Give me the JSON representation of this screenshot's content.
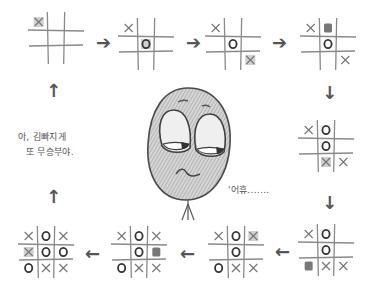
{
  "colors": {
    "ink": "#4a4a4a",
    "pencil": "#8a8a8a",
    "shade": "#777777",
    "face": "#c9c9c9"
  },
  "boards": [
    {
      "id": 1,
      "cells": [
        "Xs",
        "",
        "",
        "",
        "",
        "",
        "",
        "",
        ""
      ]
    },
    {
      "id": 2,
      "cells": [
        "X",
        "",
        "",
        "",
        "Os",
        "",
        "",
        "",
        ""
      ]
    },
    {
      "id": 3,
      "cells": [
        "X",
        "",
        "",
        "",
        "O",
        "",
        "",
        "",
        "Xs"
      ]
    },
    {
      "id": 4,
      "cells": [
        "X",
        "S",
        "",
        "",
        "O",
        "",
        "",
        "",
        "X"
      ]
    },
    {
      "id": 5,
      "cells": [
        "X",
        "O",
        "",
        "",
        "O",
        "",
        "",
        "Xs",
        "X"
      ]
    },
    {
      "id": 6,
      "cells": [
        "X",
        "O",
        "",
        "",
        "O",
        "",
        "S",
        "X",
        "X"
      ]
    },
    {
      "id": 7,
      "cells": [
        "X",
        "O",
        "Xs",
        "",
        "O",
        "",
        "O",
        "X",
        "X"
      ]
    },
    {
      "id": 8,
      "cells": [
        "X",
        "O",
        "X",
        "",
        "O",
        "S",
        "O",
        "X",
        "X"
      ]
    },
    {
      "id": 9,
      "cells": [
        "X",
        "O",
        "X",
        "Xs",
        "O",
        "O",
        "O",
        "X",
        "X"
      ]
    }
  ],
  "arrows": {
    "right": "➔",
    "down": "↓",
    "left": "←",
    "up": "↑"
  },
  "captions": {
    "left_line1": "아, 김빠지게",
    "left_line2": "또 무승부야.",
    "sigh": "'어휴......."
  }
}
